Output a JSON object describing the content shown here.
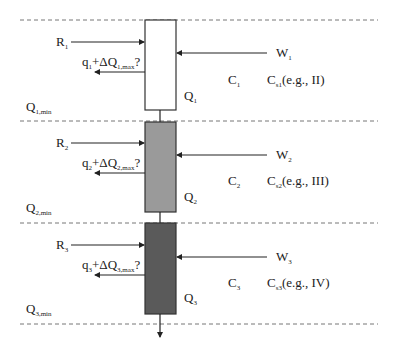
{
  "diagram": {
    "stages": [
      {
        "index": "1",
        "fill": "#ffffff",
        "R": "R",
        "R_sub": "1",
        "q_expr_q": "q",
        "q_sub": "1",
        "q_mid": "+ΔQ",
        "q_sub2": "1,max",
        "q_end": "?",
        "W": "W",
        "W_sub": "1",
        "C": "C",
        "C_sub": "1",
        "Cs": "C",
        "Cs_sub": "s1",
        "Cs_note": "(e.g., II)",
        "Q": "Q",
        "Q_sub": "1",
        "Qmin": "Q",
        "Qmin_sub": "1,min"
      },
      {
        "index": "2",
        "fill": "#9a9a9a",
        "R": "R",
        "R_sub": "2",
        "q_expr_q": "q",
        "q_sub": "2",
        "q_mid": "+ΔQ",
        "q_sub2": "2,max",
        "q_end": "?",
        "W": "W",
        "W_sub": "2",
        "C": "C",
        "C_sub": "2",
        "Cs": "C",
        "Cs_sub": "s2",
        "Cs_note": "(e.g., III)",
        "Q": "Q",
        "Q_sub": "2",
        "Qmin": "Q",
        "Qmin_sub": "2,min"
      },
      {
        "index": "3",
        "fill": "#5a5a5a",
        "R": "R",
        "R_sub": "3",
        "q_expr_q": "q",
        "q_sub": "3",
        "q_mid": "+ΔQ",
        "q_sub2": "3,max",
        "q_end": "?",
        "W": "W",
        "W_sub": "3",
        "C": "C",
        "C_sub": "3",
        "Cs": "C",
        "Cs_sub": "s3",
        "Cs_note": "(e.g., IV)",
        "Q": "Q",
        "Q_sub": "3",
        "Qmin": "Q",
        "Qmin_sub": "3,min"
      }
    ]
  }
}
